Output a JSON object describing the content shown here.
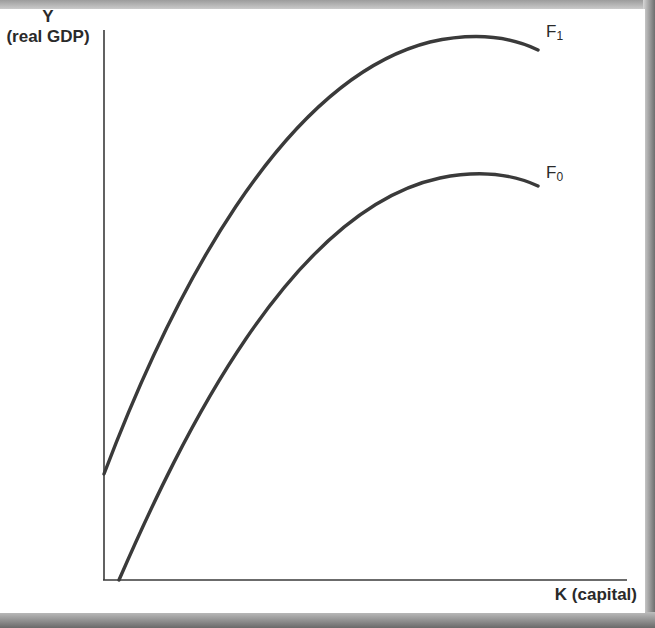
{
  "diagram": {
    "title": "",
    "y_axis": {
      "symbol": "Y",
      "label": "(real GDP)"
    },
    "x_axis": {
      "label": "K (capital)"
    },
    "curves": [
      {
        "id": "F1",
        "letter": "F",
        "subscript": "1",
        "description": "Upper production function, positive intercept on Y axis"
      },
      {
        "id": "F0",
        "letter": "F",
        "subscript": "0",
        "description": "Lower production function starting near origin"
      }
    ],
    "colors": {
      "curve": "#3a3a3a",
      "axis": "#3a3a3a",
      "background": "#ffffff"
    }
  }
}
